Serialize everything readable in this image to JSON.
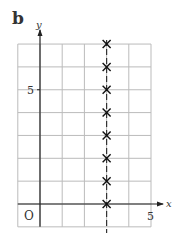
{
  "panel_label": "b",
  "chart_data": {
    "type": "scatter",
    "title": "",
    "xlabel": "x",
    "ylabel": "y",
    "xlim": [
      -1,
      5
    ],
    "ylim": [
      -1,
      7
    ],
    "grid": true,
    "origin_label": "O",
    "x_tick_labels": [
      "5"
    ],
    "y_tick_labels": [
      "5"
    ],
    "marker": "cross",
    "series": [
      {
        "name": "points",
        "x": [
          3,
          3,
          3,
          3,
          3,
          3,
          3,
          3
        ],
        "y": [
          0,
          1,
          2,
          3,
          4,
          5,
          6,
          7
        ]
      }
    ],
    "annotations": [
      {
        "type": "dashed-vertical-line",
        "x": 3
      }
    ]
  }
}
